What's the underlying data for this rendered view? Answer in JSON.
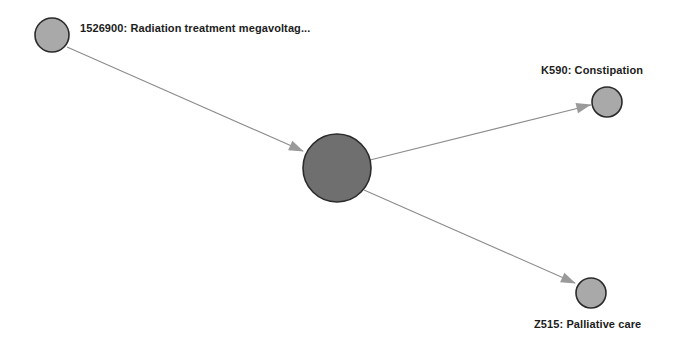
{
  "graph": {
    "background_color": "#ffffff",
    "edge_color": "#8c8c8c",
    "arrow_color": "#9a9a9a",
    "node_stroke_color": "#2b2b2b",
    "label_color": "#1c1c1c",
    "nodes": [
      {
        "id": "1526900",
        "label": "1526900: Radiation treatment megavoltag...",
        "cx": 52,
        "cy": 35,
        "r": 17,
        "fill": "#a9a9a9",
        "label_x": 80,
        "label_y": 22,
        "label_position": "right"
      },
      {
        "id": "center",
        "label": "",
        "cx": 337,
        "cy": 168,
        "r": 34,
        "fill": "#6f6f6f",
        "label_x": 0,
        "label_y": 0,
        "label_position": "none"
      },
      {
        "id": "K590",
        "label": "K590: Constipation",
        "cx": 607,
        "cy": 102,
        "r": 15,
        "fill": "#a9a9a9",
        "label_x": 541,
        "label_y": 64,
        "label_position": "above"
      },
      {
        "id": "Z515",
        "label": "Z515: Palliative care",
        "cx": 591,
        "cy": 293,
        "r": 15,
        "fill": "#a9a9a9",
        "label_x": 534,
        "label_y": 318,
        "label_position": "below"
      }
    ],
    "edges": [
      {
        "id": "edge-1526900-center",
        "from": "1526900",
        "to": "center",
        "x1": 67,
        "y1": 47,
        "x2": 303,
        "y2": 151,
        "arrow_x": 298,
        "arrow_y": 149,
        "arrow_angle": 24
      },
      {
        "id": "edge-center-K590",
        "from": "center",
        "to": "K590",
        "x1": 370,
        "y1": 160,
        "x2": 591,
        "y2": 105,
        "arrow_x": 585,
        "arrow_y": 106,
        "arrow_angle": -14
      },
      {
        "id": "edge-center-Z515",
        "from": "center",
        "to": "Z515",
        "x1": 364,
        "y1": 190,
        "x2": 575,
        "y2": 283,
        "arrow_x": 570,
        "arrow_y": 281,
        "arrow_angle": 24
      }
    ]
  }
}
